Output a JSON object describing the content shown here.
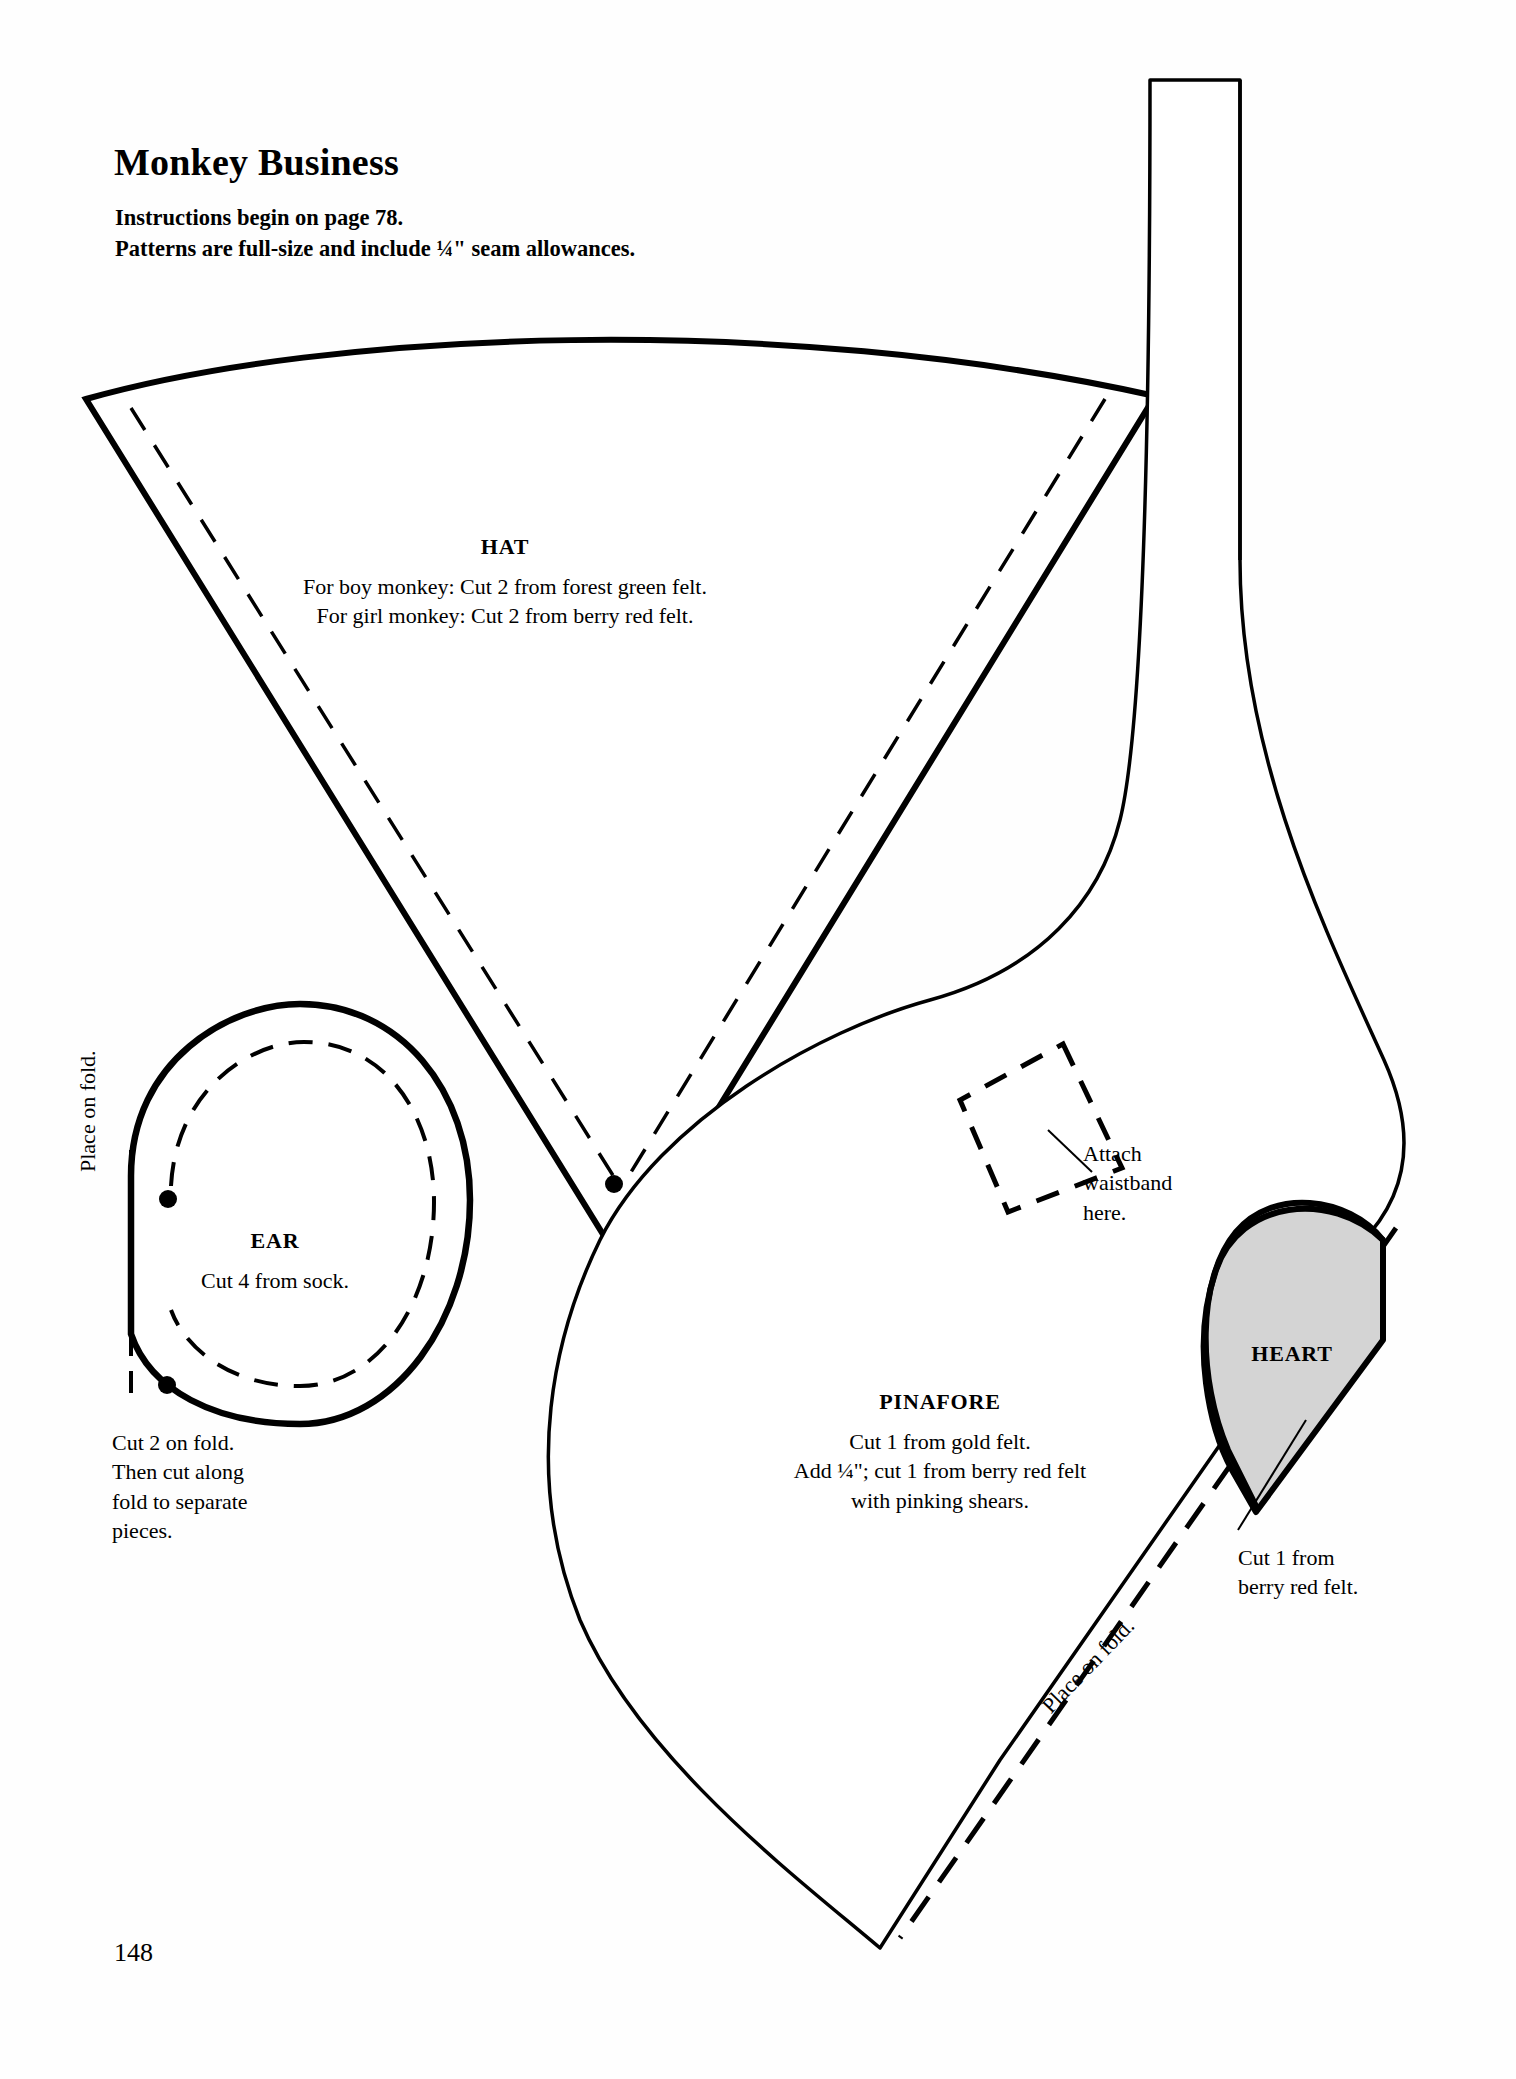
{
  "page": {
    "title": "Monkey Business",
    "instructions": [
      "Instructions begin on page 78.",
      "Patterns are full-size and include ¼\" seam allowances."
    ],
    "instructions_text": "Instructions begin on page 78.\nPatterns are full-size and include ¼\" seam allowances.",
    "page_number": "148"
  },
  "pieces": {
    "hat": {
      "label": "HAT",
      "notes": [
        "For boy monkey: Cut 2 from forest green felt.",
        "For girl monkey: Cut 2 from berry red felt."
      ],
      "notes_text": "For boy monkey: Cut 2 from forest green felt.\nFor girl monkey: Cut 2 from berry red felt."
    },
    "ear": {
      "label": "EAR",
      "note": "Cut 4 from sock.",
      "fold_label": "Place on fold.",
      "side_note_lines": [
        "Cut 2 on fold.",
        "Then cut along",
        "fold to separate",
        "pieces."
      ],
      "side_note_text": "Cut 2 on fold.\nThen cut along\nfold to separate\npieces."
    },
    "pinafore": {
      "label": "PINAFORE",
      "notes": [
        "Cut 1 from gold felt.",
        "Add ¼\"; cut 1 from berry red felt",
        "with pinking shears."
      ],
      "notes_text": "Cut 1 from gold felt.\nAdd ¼\"; cut 1 from berry red felt\nwith pinking shears.",
      "attach_note_lines": [
        "Attach",
        "waistband",
        "here."
      ],
      "attach_note_text": "Attach\nwaistband\nhere.",
      "fold_label": "Place on fold."
    },
    "heart": {
      "label": "HEART",
      "note_lines": [
        "Cut 1 from",
        "berry red felt."
      ],
      "note_text": "Cut 1 from\nberry red felt.",
      "fill_color": "#d4d4d4"
    }
  },
  "style": {
    "ink_color": "#000000",
    "paper_color": "#fefefe",
    "heart_fill": "#d4d4d4"
  }
}
